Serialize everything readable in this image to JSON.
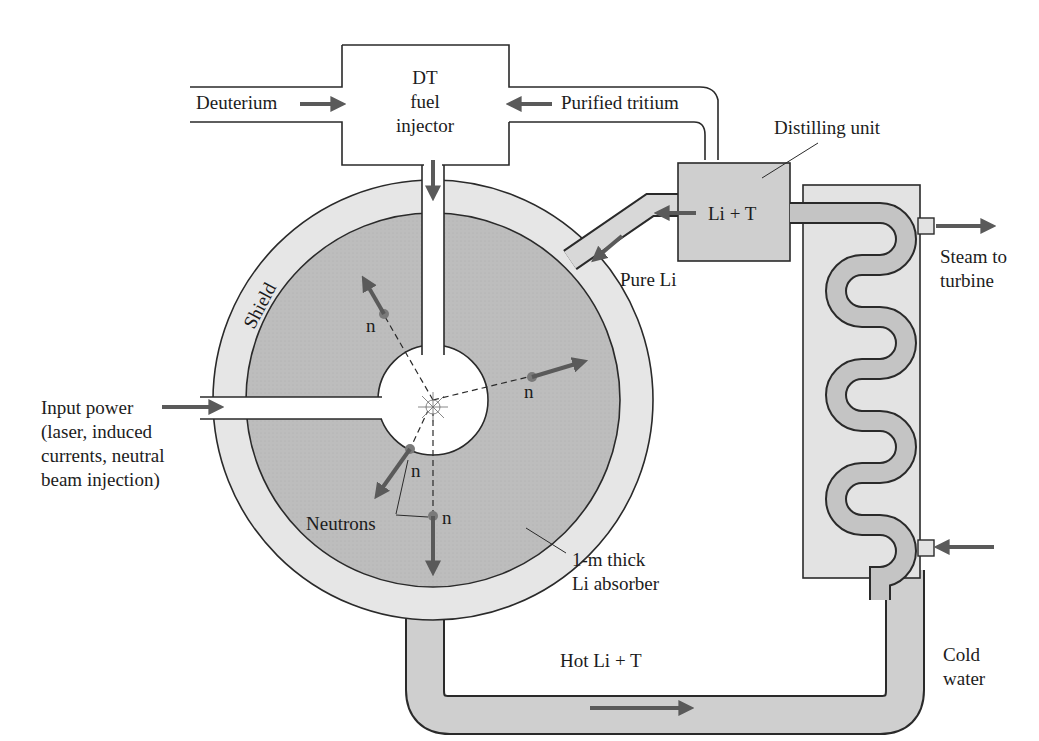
{
  "figure": {
    "colors": {
      "shield": "#e6e6e6",
      "absorber": "#bdbdbd",
      "pipe": "#cfcfcf",
      "exchanger": "#e3e3e3",
      "coil": "#c4c4c4",
      "arrow": "#5a5a5a",
      "line": "#2a2a2a"
    }
  },
  "labels": {
    "deuterium": "Deuterium",
    "injector_line1": "DT",
    "injector_line2": "fuel",
    "injector_line3": "injector",
    "purified_tritium": "Purified tritium",
    "distilling_unit": "Distilling unit",
    "li_t": "Li + T",
    "pure_li": "Pure Li",
    "steam_line1": "Steam to",
    "steam_line2": "turbine",
    "shield": "Shield",
    "input_power_line1": "Input power",
    "input_power_line2": "(laser, induced",
    "input_power_line3": "currents, neutral",
    "input_power_line4": "beam injection)",
    "neutrons": "Neutrons",
    "neutron_symbol": "n",
    "absorber_line1": "1-m thick",
    "absorber_line2": "Li absorber",
    "hot_li_t": "Hot Li + T",
    "cold_line1": "Cold",
    "cold_line2": "water"
  }
}
